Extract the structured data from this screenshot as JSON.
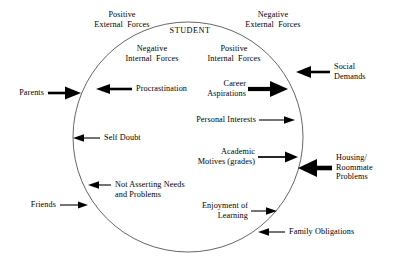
{
  "figure": {
    "title": "STUDENT",
    "boundary_shape": "circle",
    "boundary_name": "student-boundary-circle"
  },
  "quadrant_headings": {
    "positive_external": "Positive\nExternal  Forces",
    "negative_external": "Negative\nExternal  Forces",
    "negative_internal": "Negative\nInternal  Forces",
    "positive_internal": "Positive\nInternal  Forces"
  },
  "internal_forces": {
    "negative": [
      {
        "label": "Procrastination",
        "direction": "outward-left",
        "weight": "bold"
      },
      {
        "label": "Self Doubt",
        "direction": "outward-left",
        "weight": "thin"
      },
      {
        "label": "Not Asserting Needs\nand Problems",
        "direction": "outward-left",
        "weight": "thin"
      }
    ],
    "positive": [
      {
        "label": "Career\nAspirations",
        "direction": "outward-right",
        "weight": "bold"
      },
      {
        "label": "Personal Interests",
        "direction": "outward-right",
        "weight": "thin"
      },
      {
        "label": "Academic\nMotives (grades)",
        "direction": "outward-right",
        "weight": "medium"
      },
      {
        "label": "Enjoyment of\nLearning",
        "direction": "outward-right",
        "weight": "thin"
      }
    ]
  },
  "external_forces": {
    "positive": [
      {
        "label": "Parents",
        "direction": "inward-right",
        "weight": "bold"
      },
      {
        "label": "Friends",
        "direction": "inward-right",
        "weight": "thin"
      }
    ],
    "negative": [
      {
        "label": "Social\nDemands",
        "direction": "inward-left",
        "weight": "bold"
      },
      {
        "label": "Housing/\nRoommate\nProblems",
        "direction": "inward-left",
        "weight": "extra-bold"
      },
      {
        "label": "Family Obligations",
        "direction": "inward-left",
        "weight": "thin"
      }
    ]
  },
  "colors": {
    "ink": "#000000",
    "background": "#ffffff",
    "circle_stroke": "#555555"
  }
}
